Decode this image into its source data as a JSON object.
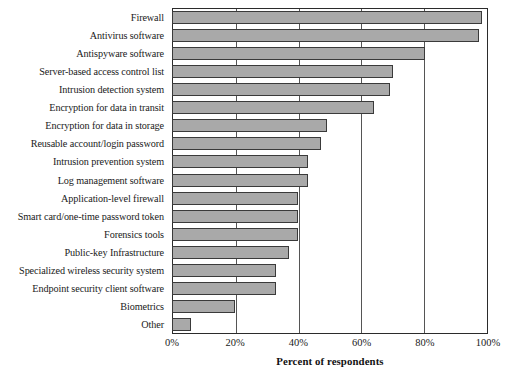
{
  "chart_data": {
    "type": "bar",
    "orientation": "horizontal",
    "title": "",
    "xlabel": "Percent of respondents",
    "ylabel": "",
    "xlim": [
      0,
      100
    ],
    "ylim": null,
    "grid": true,
    "legend": null,
    "tick_labels": [
      "0%",
      "20%",
      "40%",
      "60%",
      "80%",
      "100%"
    ],
    "tick_values": [
      0,
      20,
      40,
      60,
      80,
      100
    ],
    "bar_color": "#a9a9a9",
    "bar_border_color": "#3a3a3a",
    "categories": [
      "Firewall",
      "Antivirus software",
      "Antispyware software",
      "Server-based access control list",
      "Intrusion detection system",
      "Encryption for data in transit",
      "Encryption for data in storage",
      "Reusable account/login password",
      "Intrusion prevention system",
      "Log management software",
      "Application-level firewall",
      "Smart card/one-time password token",
      "Forensics tools",
      "Public-key Infrastructure",
      "Specialized wireless security system",
      "Endpoint security client software",
      "Biometrics",
      "Other"
    ],
    "values": [
      98,
      97,
      80,
      70,
      69,
      64,
      49,
      47,
      43,
      43,
      40,
      40,
      40,
      37,
      33,
      33,
      20,
      6
    ]
  }
}
